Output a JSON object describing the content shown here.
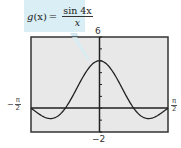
{
  "callout": {
    "function_name": "g",
    "argument": "(x)",
    "equals": "=",
    "numerator": "sin 4x",
    "denominator": "x",
    "background_color": "#d9eef5"
  },
  "labels": {
    "ymax": "6",
    "ymin": "−2",
    "xmin_sign": "−",
    "xmin_num": "π",
    "xmin_den": "2",
    "xmax_num": "π",
    "xmax_den": "2"
  },
  "chart_data": {
    "type": "line",
    "xlabel": "",
    "ylabel": "",
    "xlim": [
      -1.5708,
      1.5708
    ],
    "ylim": [
      -2,
      6
    ],
    "x_tick_labels": [
      "-π/2",
      "π/2"
    ],
    "y_tick_labels": [
      "-2",
      "6"
    ],
    "y_ticks_minor": [
      -2,
      -1,
      0,
      1,
      2,
      3,
      4,
      5,
      6
    ],
    "grid": false,
    "series": [
      {
        "name": "g(x) = sin(4x)/x",
        "x": [
          -1.5708,
          -1.3,
          -1.1,
          -0.9,
          -0.785,
          -0.6,
          -0.4,
          -0.2,
          0,
          0.2,
          0.4,
          0.6,
          0.785,
          0.9,
          1.1,
          1.3,
          1.5708
        ],
        "values": [
          0.0,
          -0.68,
          -0.87,
          -0.49,
          0.0,
          1.13,
          2.5,
          3.59,
          4.0,
          3.59,
          2.5,
          1.13,
          0.0,
          -0.49,
          -0.87,
          -0.68,
          0.0
        ]
      }
    ],
    "colors": {
      "plot_background": "#e8e8e8",
      "curve": "#222222",
      "axes": "#222222",
      "frame": "#333333"
    }
  }
}
